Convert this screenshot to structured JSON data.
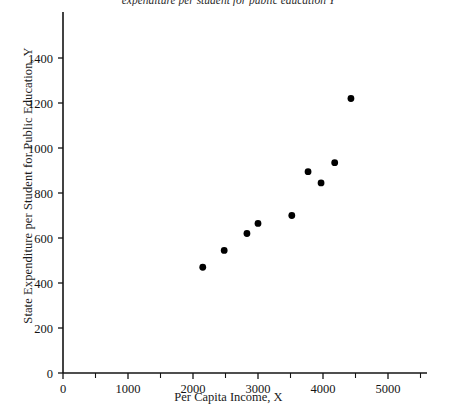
{
  "chart_data": {
    "type": "scatter",
    "title": "expenditure per student for public education Y",
    "xlabel": "Per Capita Income, X",
    "ylabel": "State Expenditure per Student for Public Education, Y",
    "xlim": [
      0,
      5600
    ],
    "ylim": [
      0,
      1500
    ],
    "grid": false,
    "legend": null,
    "x_ticks": [
      0,
      1000,
      2000,
      3000,
      4000,
      5000
    ],
    "x_tick_labels": [
      "0",
      "1000",
      "2000",
      "3000",
      "4000",
      "5000"
    ],
    "x_minor_ticks": [
      500,
      1500,
      2500,
      3500,
      4500,
      5500
    ],
    "y_ticks": [
      0,
      200,
      400,
      600,
      800,
      1000,
      1200,
      1400
    ],
    "y_tick_labels": [
      "0",
      "200",
      "400",
      "600",
      "800",
      "1000",
      "1200",
      "1400"
    ],
    "points": [
      {
        "x": 2150,
        "y": 470
      },
      {
        "x": 2480,
        "y": 545
      },
      {
        "x": 2830,
        "y": 620
      },
      {
        "x": 3000,
        "y": 665
      },
      {
        "x": 3520,
        "y": 700
      },
      {
        "x": 3770,
        "y": 895
      },
      {
        "x": 3970,
        "y": 845
      },
      {
        "x": 4180,
        "y": 935
      },
      {
        "x": 4430,
        "y": 1220
      }
    ]
  }
}
